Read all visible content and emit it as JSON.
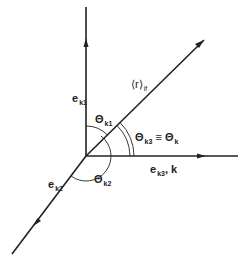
{
  "diagram": {
    "type": "vector coordinate diagram",
    "line_color": "#222222",
    "background": "#ffffff",
    "axes": {
      "e_k1": {
        "base": "e",
        "sub": "k1"
      },
      "e_k2": {
        "base": "e",
        "sub": "k2"
      },
      "e_k3": {
        "base": "e",
        "sub": "k3",
        "suffix": ", k"
      },
      "r_vector": {
        "base": "⟨r⟩",
        "sub": "if"
      }
    },
    "angles": {
      "theta_k1": {
        "base": "Θ",
        "sub": "k1"
      },
      "theta_k2": {
        "base": "Θ",
        "sub": "k2"
      },
      "theta_k3": {
        "base": "Θ",
        "sub": "k3",
        "eq": " ≡ ",
        "base2": "Θ",
        "sub2": "k"
      }
    }
  }
}
